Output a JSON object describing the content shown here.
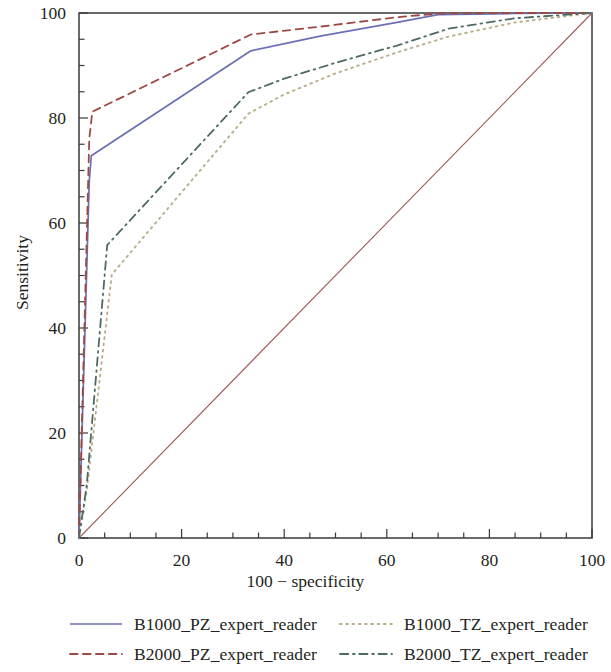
{
  "chart_data": {
    "type": "line",
    "title": "",
    "xlabel": "100 − specificity",
    "ylabel": "Sensitivity",
    "xlim": [
      0,
      100
    ],
    "ylim": [
      0,
      100
    ],
    "xticks": [
      0,
      20,
      40,
      60,
      80,
      100
    ],
    "yticks": [
      0,
      20,
      40,
      60,
      80,
      100
    ],
    "xtick_labels": [
      "0",
      "20",
      "40",
      "60",
      "80",
      "100"
    ],
    "ytick_labels": [
      "0",
      "20",
      "40",
      "60",
      "80",
      "100"
    ],
    "minor_tick_step": 5,
    "grid": false,
    "legend_position": "below",
    "reference_line": {
      "name": "reference-diagonal",
      "x": [
        0,
        100
      ],
      "y": [
        0,
        100
      ],
      "color": "#9e5a55",
      "style": "solid",
      "width": 1.1
    },
    "series": [
      {
        "name": "B1000_PZ_expert_reader",
        "color": "#6b6fb4",
        "style": "solid",
        "width": 1.7,
        "x": [
          0,
          2,
          2.4,
          33.5,
          47,
          62,
          70,
          85,
          100
        ],
        "y": [
          0,
          68,
          72.8,
          92.8,
          95.6,
          98.2,
          99.7,
          99.9,
          100
        ]
      },
      {
        "name": "B2000_PZ_expert_reader",
        "color": "#9b4a46",
        "style": "dashed",
        "width": 1.8,
        "x": [
          0,
          2,
          2.6,
          33.5,
          47,
          62,
          70,
          85,
          100
        ],
        "y": [
          0,
          76,
          81.2,
          95.9,
          97.4,
          99.2,
          99.9,
          100,
          100
        ]
      },
      {
        "name": "B1000_TZ_expert_reader",
        "color": "#b9b08a",
        "style": "dotted",
        "width": 1.9,
        "x": [
          0,
          1.5,
          6.4,
          33,
          40,
          50,
          62,
          72,
          85,
          100
        ],
        "y": [
          0,
          9,
          50.2,
          80.8,
          84.5,
          88.5,
          92.5,
          95.5,
          98.2,
          100
        ]
      },
      {
        "name": "B2000_TZ_expert_reader",
        "color": "#4d6b63",
        "style": "dashdot",
        "width": 1.8,
        "x": [
          0,
          1.5,
          5.5,
          33,
          40,
          50,
          62,
          72,
          85,
          100
        ],
        "y": [
          0,
          10,
          55.8,
          84.9,
          87.5,
          90.5,
          93.8,
          97.0,
          99.0,
          100
        ]
      }
    ]
  },
  "legend": {
    "entries": [
      {
        "label": "B1000_PZ_expert_reader",
        "series": 0
      },
      {
        "label": "B1000_TZ_expert_reader",
        "series": 2
      },
      {
        "label": "B2000_PZ_expert_reader",
        "series": 1
      },
      {
        "label": "B2000_TZ_expert_reader",
        "series": 3
      }
    ]
  },
  "axes": {
    "x_title": "100 − specificity",
    "y_title": "Sensitivity"
  }
}
